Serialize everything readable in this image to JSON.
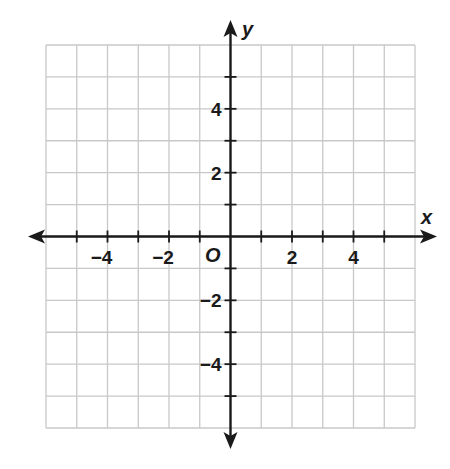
{
  "chart_data": {
    "type": "scatter",
    "title": "",
    "xlabel": "x",
    "ylabel": "y",
    "origin_label": "O",
    "xlim": [
      -6,
      6
    ],
    "ylim": [
      -6,
      6
    ],
    "grid": true,
    "grid_step": 1,
    "x_ticks": [
      -5,
      -4,
      -3,
      -2,
      -1,
      1,
      2,
      3,
      4,
      5
    ],
    "y_ticks": [
      -5,
      -4,
      -3,
      -2,
      -1,
      1,
      2,
      3,
      4,
      5
    ],
    "x_tick_labels": [
      {
        "value": -4,
        "label": "−4"
      },
      {
        "value": -2,
        "label": "−2"
      },
      {
        "value": 2,
        "label": "2"
      },
      {
        "value": 4,
        "label": "4"
      }
    ],
    "y_tick_labels": [
      {
        "value": 4,
        "label": "4"
      },
      {
        "value": 2,
        "label": "2"
      },
      {
        "value": -2,
        "label": "−2"
      },
      {
        "value": -4,
        "label": "−4"
      }
    ],
    "series": [],
    "legend": null
  },
  "colors": {
    "grid": "#c8c8c8",
    "axis": "#1a1a1a",
    "background": "#ffffff"
  }
}
